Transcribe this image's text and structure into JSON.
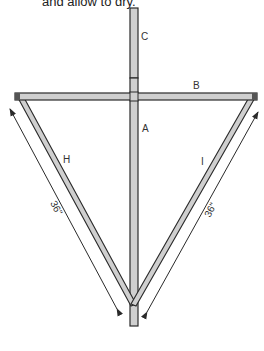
{
  "caption": "and allow to dry.",
  "parts": {
    "A": {
      "label": "A"
    },
    "B": {
      "label": "B"
    },
    "C": {
      "label": "C"
    },
    "H": {
      "label": "H"
    },
    "I": {
      "label": "I"
    }
  },
  "dimensions": {
    "left": "36\"",
    "right": "36\""
  },
  "colors": {
    "wood_fill": "#cfcfcf",
    "outline": "#2a2a2a"
  }
}
